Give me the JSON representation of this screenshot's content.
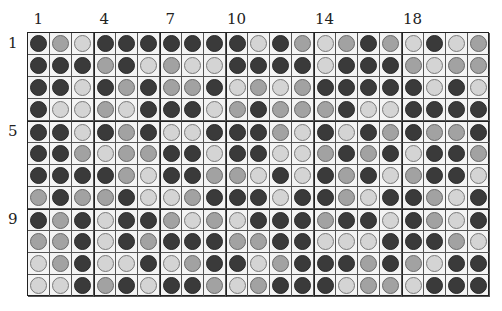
{
  "grid": {
    "columns": 21,
    "rows": 12,
    "colors": {
      "D": "#3a3a3a",
      "M": "#a2a2a2",
      "L": "#d4d4d4"
    },
    "thick_before_cols": [
      4,
      7,
      10,
      14,
      18
    ],
    "thick_before_rows": [
      5,
      9
    ],
    "cells": [
      "DMLDDDDDDDLDMLMDMLDLM",
      "DDDMDLMLLDDDDLDDDMLMM",
      "DDLDMDMMDLMLMDDDDDLDL",
      "DLLMLDDDLMDMMMDLLDDDD",
      "DDLDMDLLDDDMLDLDMDMMD",
      "DDMLMMDDLDDLLMDMDLDDM",
      "DDDDMLDDMMLDLDMDLMDDL",
      "MDMMDLLMDDDLDDMLDDMLD",
      "DMDLDDMLMLDDDMDDLDMLD",
      "MMDLDMDDDMMDDLLLDDDML",
      "LMDLLDLMDDLMDDDMDMLDD",
      "LLDMDLDDMLMDDDLMMLDDD"
    ]
  },
  "column_labels": [
    {
      "text": "1",
      "col": 1
    },
    {
      "text": "4",
      "col": 4
    },
    {
      "text": "7",
      "col": 7
    },
    {
      "text": "10",
      "col": 10
    },
    {
      "text": "14",
      "col": 14
    },
    {
      "text": "18",
      "col": 18
    }
  ],
  "row_labels": [
    {
      "text": "1",
      "row": 1
    },
    {
      "text": "5",
      "row": 5
    },
    {
      "text": "9",
      "row": 9
    }
  ]
}
